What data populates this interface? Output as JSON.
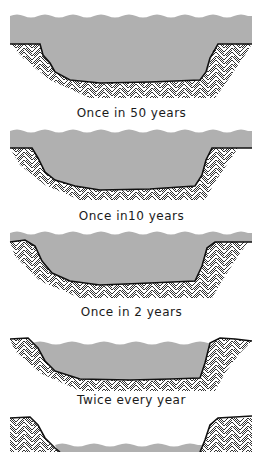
{
  "diagram": {
    "type": "river channel cross-sections showing flood frequency",
    "colors": {
      "water": "#b0b0b0",
      "bank_line": "#111111",
      "hatch": "#333333",
      "background": "#ffffff"
    },
    "panels": [
      {
        "label": "Once in 50 years",
        "stage": "overbank flood"
      },
      {
        "label": "Once in10 years",
        "stage": "high overbank"
      },
      {
        "label": "Once in 2 years",
        "stage": "bankfull"
      },
      {
        "label": "Twice every year",
        "stage": "near bankfull"
      },
      {
        "label": "",
        "stage": "low flow"
      }
    ]
  }
}
